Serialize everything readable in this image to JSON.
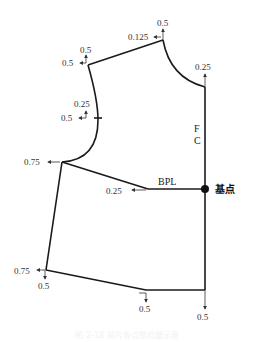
{
  "diagram": {
    "labels": {
      "neck_side_up": "0.5",
      "neck_side_left": "0.125",
      "shoulder_up": "0.5",
      "shoulder_left": "0.5",
      "front_neck_up": "0.25",
      "notch_up": "0.25",
      "notch_left": "0.5",
      "underarm_left": "0.75",
      "bpl_left": "0.25",
      "bpl_text": "BPL",
      "fc_f": "F",
      "fc_c": "C",
      "base_point": "基点",
      "side_hem_left": "0.75",
      "side_hem_down": "0.5",
      "hem_mid_down": "0.5",
      "center_hem_down": "0.5"
    },
    "caption": "图 2-18 前片各点推档量示意"
  },
  "colors": {
    "line": "#1a1a1a",
    "text": "#333333",
    "background": "#ffffff"
  }
}
